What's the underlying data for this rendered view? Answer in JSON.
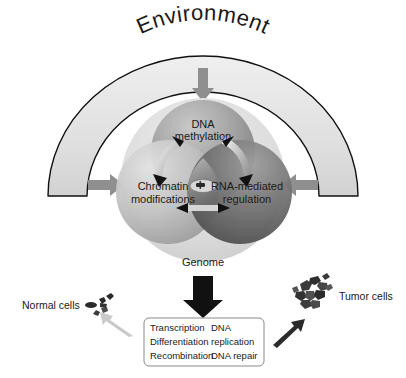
{
  "figure": {
    "environment_label": "Environment",
    "genome_label": "Genome"
  },
  "spheres": [
    {
      "id": "dna-methylation",
      "line1": "DNA",
      "line2": "methylation",
      "color": "#9a9a9a"
    },
    {
      "id": "chromatin-modifications",
      "line1": "Chromatin",
      "line2": "modifications",
      "color": "#bdbdbd"
    },
    {
      "id": "rna-mediated-regulation",
      "line1": "RNA-mediated",
      "line2": "regulation",
      "color": "#6f6f6f"
    }
  ],
  "processes": {
    "column_left": [
      "Transcription",
      "Differentiation",
      "Recombination"
    ],
    "column_right": [
      "DNA",
      "replication",
      "DNA repair"
    ]
  },
  "cells": {
    "normal_label": "Normal cells",
    "tumor_label": "Tumor cells"
  },
  "colors": {
    "arc_fill": "#e3e3e3",
    "arc_stroke": "#111111",
    "outer_circle": "#dedede",
    "gray_arrow": "#8f8f8f",
    "black_arrow": "#111111",
    "pale_arrow": "#c9c9c9",
    "box_stroke": "#8a8a8a",
    "text": "#1a1a1a"
  }
}
